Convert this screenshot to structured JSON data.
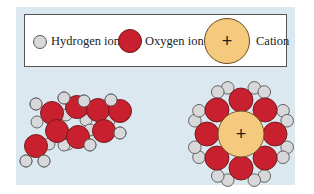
{
  "legend": {
    "hydrogen": {
      "label": "Hydrogen ion",
      "color": "#d8d8da"
    },
    "oxygen": {
      "label": "Oxygen ion",
      "color": "#c8202e"
    },
    "cation": {
      "label": "Cation",
      "symbol": "+",
      "color": "#f5c97e"
    }
  },
  "panel_color": "#dbe8f0",
  "hydrated_cation": {
    "symbol": "+",
    "water_count": 8
  }
}
